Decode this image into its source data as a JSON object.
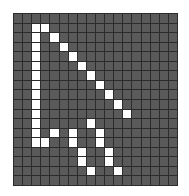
{
  "editor": {
    "name": "pixel-grid-editor",
    "grid": {
      "columns": 18,
      "rows": 18,
      "off_color": "#5a5a5a",
      "on_color": "#ffffff",
      "line_color": "#2b2b2b"
    },
    "icon": "arrow-cursor",
    "on_pixels": [
      [
        1,
        2
      ],
      [
        1,
        3
      ],
      [
        2,
        2
      ],
      [
        2,
        4
      ],
      [
        3,
        2
      ],
      [
        3,
        5
      ],
      [
        4,
        2
      ],
      [
        4,
        6
      ],
      [
        5,
        2
      ],
      [
        5,
        7
      ],
      [
        6,
        2
      ],
      [
        6,
        8
      ],
      [
        7,
        2
      ],
      [
        7,
        9
      ],
      [
        8,
        2
      ],
      [
        8,
        10
      ],
      [
        9,
        2
      ],
      [
        9,
        11
      ],
      [
        10,
        2
      ],
      [
        10,
        12
      ],
      [
        11,
        2
      ],
      [
        11,
        8
      ],
      [
        12,
        2
      ],
      [
        12,
        4
      ],
      [
        12,
        6
      ],
      [
        12,
        9
      ],
      [
        13,
        2
      ],
      [
        13,
        3
      ],
      [
        13,
        6
      ],
      [
        13,
        9
      ],
      [
        14,
        7
      ],
      [
        14,
        10
      ],
      [
        15,
        7
      ],
      [
        15,
        10
      ],
      [
        16,
        8
      ],
      [
        16,
        11
      ]
    ]
  }
}
